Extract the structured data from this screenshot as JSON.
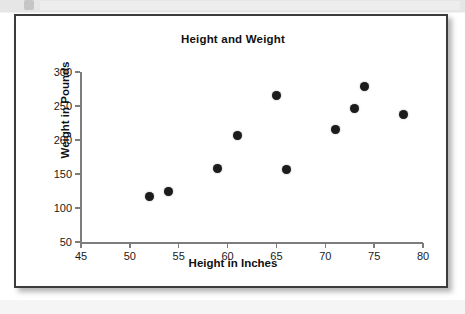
{
  "chart_data": {
    "type": "scatter",
    "title": "Height and Weight",
    "xlabel": "Height in Inches",
    "ylabel": "Weight in Pounds",
    "xlim": [
      45,
      80
    ],
    "ylim": [
      50,
      300
    ],
    "xticks": [
      45,
      50,
      55,
      60,
      65,
      70,
      75,
      80
    ],
    "yticks": [
      50,
      100,
      150,
      200,
      250,
      300
    ],
    "xtick_labels": [
      "45",
      "50",
      "55",
      "60",
      "65",
      "70",
      "75",
      "80"
    ],
    "ytick_labels": [
      "50",
      "100",
      "150",
      "200",
      "250",
      "300"
    ],
    "grid": false,
    "legend": null,
    "marker_color": "#1c1c1c",
    "points": [
      {
        "x": 52,
        "y": 117
      },
      {
        "x": 54,
        "y": 124
      },
      {
        "x": 59,
        "y": 158
      },
      {
        "x": 61,
        "y": 207
      },
      {
        "x": 65,
        "y": 266
      },
      {
        "x": 66,
        "y": 156
      },
      {
        "x": 71,
        "y": 215
      },
      {
        "x": 73,
        "y": 247
      },
      {
        "x": 74,
        "y": 278
      },
      {
        "x": 78,
        "y": 238
      }
    ]
  },
  "page": {
    "background_color": "#ffffff",
    "banner_color": "#e6e6e6",
    "card_border_color": "#3c3c3c"
  }
}
